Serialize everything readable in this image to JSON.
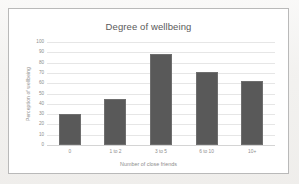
{
  "chart_data": {
    "type": "bar",
    "title": "Degree of wellbeing",
    "xlabel": "Number of close friends",
    "ylabel": "Perception of wellbeing",
    "categories": [
      "0",
      "1 to 2",
      "3 to 5",
      "6 to 10",
      "10+"
    ],
    "values": [
      30,
      45,
      88,
      71,
      62
    ],
    "ylim": [
      0,
      100
    ],
    "yticks": [
      0,
      10,
      20,
      30,
      40,
      50,
      60,
      70,
      80,
      90,
      100
    ],
    "ytick_labels": [
      "0",
      "10",
      "20",
      "30",
      "40",
      "50",
      "60",
      "70",
      "80",
      "90",
      "100"
    ],
    "grid": true,
    "legend": false,
    "series": [
      {
        "name": "Perception of wellbeing",
        "values": [
          30,
          45,
          88,
          71,
          62
        ],
        "color": "#595959"
      }
    ]
  },
  "colors": {
    "bar": "#595959",
    "gridline": "#e6e6e6",
    "axis_text": "#8d8d8d",
    "title_text": "#5a5a5a",
    "chart_border": "#b9b9b9",
    "chart_background": "#ffffff",
    "page_background": "#f2f1ef"
  }
}
